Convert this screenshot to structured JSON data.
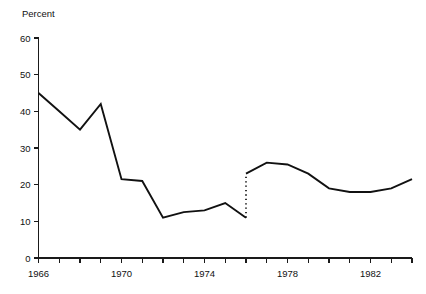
{
  "chart_data": {
    "type": "line",
    "title": "",
    "ylabel": "Percent",
    "xlabel": "",
    "ylim": [
      0,
      60
    ],
    "xlim": [
      1966,
      1984
    ],
    "grid": false,
    "legend": null,
    "y_ticks": [
      0,
      10,
      20,
      30,
      40,
      50,
      60
    ],
    "y_tick_labels": [
      "0",
      "10",
      "20",
      "30",
      "40",
      "50",
      "60"
    ],
    "x_ticks": [
      1966,
      1967,
      1968,
      1969,
      1970,
      1971,
      1972,
      1973,
      1974,
      1975,
      1976,
      1977,
      1978,
      1979,
      1980,
      1981,
      1982,
      1983,
      1984
    ],
    "x_tick_labels": [
      "1966",
      "",
      "",
      "",
      "1970",
      "",
      "",
      "",
      "1974",
      "",
      "",
      "",
      "1978",
      "",
      "",
      "",
      "1982",
      "",
      ""
    ],
    "x_labeled_ticks": [
      {
        "x": 1966,
        "label": "1966"
      },
      {
        "x": 1970,
        "label": "1970"
      },
      {
        "x": 1974,
        "label": "1974"
      },
      {
        "x": 1978,
        "label": "1978"
      },
      {
        "x": 1982,
        "label": "1982"
      }
    ],
    "series": [
      {
        "name": "segment-1",
        "x": [
          1966,
          1967,
          1968,
          1969,
          1970,
          1971,
          1972,
          1973,
          1974,
          1975,
          1976
        ],
        "values": [
          45,
          40,
          35,
          42,
          21.5,
          21,
          11,
          12.5,
          13,
          15,
          11
        ]
      },
      {
        "name": "segment-2",
        "x": [
          1976,
          1977,
          1978,
          1979,
          1980,
          1981,
          1982,
          1983,
          1984
        ],
        "values": [
          23,
          26,
          25.5,
          23,
          19,
          18,
          18,
          19,
          21.5
        ]
      }
    ],
    "annotations": [
      {
        "type": "series-break",
        "style": "dotted-vertical",
        "x": 1976,
        "y_from": 11,
        "y_to": 23
      }
    ]
  }
}
